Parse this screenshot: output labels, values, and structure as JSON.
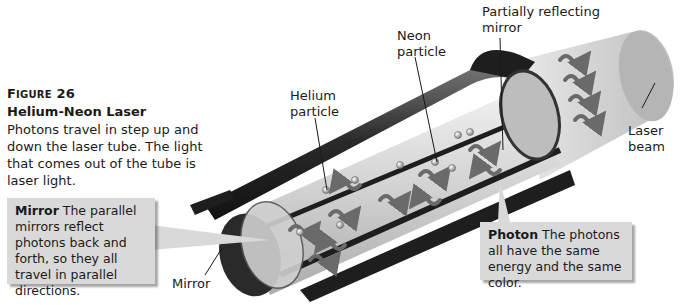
{
  "figure": {
    "number_prefix": "F",
    "number_smallcaps": "IGURE",
    "number": "26",
    "title": "Helium-Neon Laser",
    "caption": "Photons travel in step up and down the laser tube. The light that comes out of the tube is laser light."
  },
  "labels": {
    "helium_line1": "Helium",
    "helium_line2": "particle",
    "neon_line1": "Neon",
    "neon_line2": "particle",
    "partial_mirror_line1": "Partially reflecting",
    "partial_mirror_line2": "mirror",
    "laser_line1": "Laser",
    "laser_line2": "beam",
    "mirror": "Mirror"
  },
  "callouts": {
    "mirror": {
      "term": "Mirror",
      "text": " The parallel mirrors reflect photons back and forth, so they all travel in parallel directions."
    },
    "photon": {
      "term": "Photon",
      "text": " The photons all have the same energy and the same color."
    }
  },
  "colors": {
    "callout_bg": "#d9d9d9",
    "tube_dark": "#1e1e1e",
    "glass": "#d8d8d8",
    "photon": "#6a6a6a"
  }
}
